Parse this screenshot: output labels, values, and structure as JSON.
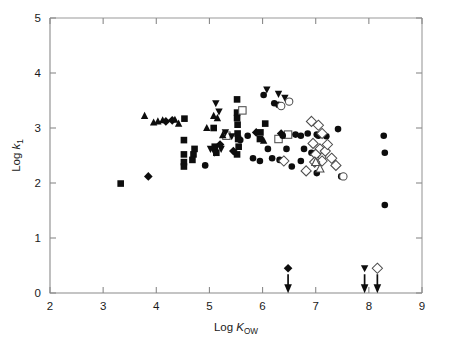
{
  "chart_data": {
    "type": "scatter",
    "title": "",
    "xlabel": "Log K_OW",
    "ylabel": "Log k_1",
    "xlabel_parts": {
      "prefix": "Log ",
      "symbol": "K",
      "subscript": "OW"
    },
    "ylabel_parts": {
      "prefix": "Log ",
      "symbol": "k",
      "subscript": "1"
    },
    "xlim": [
      2,
      9
    ],
    "ylim": [
      0,
      5
    ],
    "xticks": [
      2,
      3,
      4,
      5,
      6,
      7,
      8,
      9
    ],
    "yticks": [
      0,
      1,
      2,
      3,
      4,
      5
    ],
    "xticklabels": [
      "2",
      "3",
      "4",
      "5",
      "6",
      "7",
      "8",
      "9"
    ],
    "yticklabels": [
      "0",
      "1",
      "2",
      "3",
      "4",
      "5"
    ],
    "grid": false,
    "legend": "none",
    "marker_styles": {
      "filled-circle": {
        "shape": "circle",
        "fill": "#0d0d0d",
        "size": 6.6
      },
      "open-circle": {
        "shape": "circle",
        "fill": "#ffffff",
        "size": 7.4
      },
      "filled-square": {
        "shape": "square",
        "fill": "#0d0d0d",
        "size": 6.6
      },
      "open-square": {
        "shape": "square",
        "fill": "#ffffff",
        "size": 7.4
      },
      "filled-triangle-up": {
        "shape": "triangle-up",
        "fill": "#0d0d0d",
        "size": 7.4
      },
      "open-triangle-up": {
        "shape": "triangle-up",
        "fill": "#ffffff",
        "size": 8.0
      },
      "filled-triangle-down": {
        "shape": "triangle-down",
        "fill": "#0d0d0d",
        "size": 7.4
      },
      "filled-diamond": {
        "shape": "diamond",
        "fill": "#0d0d0d",
        "size": 7.0
      },
      "open-diamond": {
        "shape": "diamond",
        "fill": "#ffffff",
        "size": 8.2
      }
    },
    "series": [
      {
        "name": "filled-square",
        "marker": "filled-square",
        "points": [
          [
            3.33,
            1.99
          ],
          [
            4.52,
            2.78
          ],
          [
            4.52,
            2.52
          ],
          [
            4.52,
            2.38
          ],
          [
            4.52,
            2.3
          ],
          [
            4.53,
            3.17
          ],
          [
            5.08,
            3.0
          ],
          [
            5.1,
            2.66
          ],
          [
            5.13,
            2.55
          ],
          [
            5.52,
            3.52
          ],
          [
            5.52,
            3.28
          ],
          [
            5.52,
            3.18
          ],
          [
            5.53,
            3.06
          ],
          [
            5.53,
            2.9
          ],
          [
            5.54,
            2.8
          ],
          [
            5.55,
            2.66
          ],
          [
            5.52,
            2.52
          ],
          [
            4.72,
            2.62
          ],
          [
            4.7,
            2.52
          ],
          [
            4.68,
            2.42
          ],
          [
            5.96,
            2.92
          ],
          [
            5.95,
            2.8
          ],
          [
            6.05,
            3.08
          ]
        ]
      },
      {
        "name": "open-square",
        "marker": "open-square",
        "points": [
          [
            5.62,
            3.32
          ],
          [
            5.32,
            2.86
          ],
          [
            6.3,
            2.8
          ],
          [
            6.48,
            2.88
          ]
        ]
      },
      {
        "name": "filled-triangle-up",
        "marker": "filled-triangle-up",
        "points": [
          [
            3.78,
            3.22
          ],
          [
            3.95,
            3.1
          ],
          [
            4.03,
            3.12
          ],
          [
            4.12,
            3.14
          ],
          [
            4.35,
            3.15
          ],
          [
            4.42,
            3.08
          ],
          [
            4.95,
            3.0
          ],
          [
            5.08,
            3.22
          ],
          [
            5.15,
            3.18
          ],
          [
            5.25,
            2.87
          ],
          [
            6.02,
            2.77
          ]
        ]
      },
      {
        "name": "filled-triangle-down",
        "marker": "filled-triangle-down",
        "points": [
          [
            5.12,
            3.45
          ],
          [
            5.18,
            3.3
          ],
          [
            5.02,
            2.62
          ],
          [
            5.1,
            2.55
          ],
          [
            5.22,
            2.62
          ],
          [
            5.3,
            2.92
          ],
          [
            5.42,
            2.85
          ],
          [
            6.08,
            3.7
          ],
          [
            6.3,
            3.62
          ],
          [
            6.42,
            3.55
          ]
        ]
      },
      {
        "name": "filled-diamond",
        "marker": "filled-diamond",
        "points": [
          [
            3.85,
            2.12
          ],
          [
            4.18,
            3.12
          ],
          [
            4.3,
            3.14
          ],
          [
            5.2,
            2.7
          ],
          [
            5.45,
            2.58
          ],
          [
            5.88,
            2.92
          ],
          [
            6.35,
            2.9
          ]
        ]
      },
      {
        "name": "filled-circle",
        "marker": "filled-circle",
        "points": [
          [
            4.92,
            2.32
          ],
          [
            5.72,
            2.86
          ],
          [
            5.58,
            2.78
          ],
          [
            6.02,
            3.6
          ],
          [
            6.22,
            3.45
          ],
          [
            6.3,
            3.42
          ],
          [
            6.38,
            2.86
          ],
          [
            6.45,
            2.62
          ],
          [
            6.1,
            2.62
          ],
          [
            6.18,
            2.45
          ],
          [
            6.32,
            2.42
          ],
          [
            5.95,
            2.4
          ],
          [
            6.62,
            2.88
          ],
          [
            6.72,
            2.86
          ],
          [
            6.85,
            2.9
          ],
          [
            6.78,
            2.62
          ],
          [
            6.92,
            2.55
          ],
          [
            6.72,
            2.4
          ],
          [
            7.02,
            2.88
          ],
          [
            7.05,
            2.86
          ],
          [
            7.12,
            2.88
          ],
          [
            7.42,
            2.98
          ],
          [
            7.02,
            2.18
          ],
          [
            7.48,
            2.12
          ],
          [
            8.28,
            2.86
          ],
          [
            8.3,
            2.55
          ],
          [
            8.3,
            1.6
          ],
          [
            5.82,
            2.45
          ],
          [
            6.55,
            2.3
          ],
          [
            7.2,
            2.85
          ]
        ]
      },
      {
        "name": "open-circle",
        "marker": "open-circle",
        "points": [
          [
            6.5,
            3.48
          ],
          [
            6.35,
            3.4
          ],
          [
            7.12,
            2.48
          ],
          [
            7.52,
            2.12
          ]
        ]
      },
      {
        "name": "open-diamond",
        "marker": "open-diamond",
        "points": [
          [
            6.92,
            3.12
          ],
          [
            7.05,
            3.05
          ],
          [
            7.12,
            2.9
          ],
          [
            6.95,
            2.72
          ],
          [
            7.08,
            2.62
          ],
          [
            7.0,
            2.52
          ],
          [
            7.18,
            2.58
          ],
          [
            7.22,
            2.7
          ],
          [
            7.3,
            2.45
          ],
          [
            7.12,
            2.4
          ],
          [
            6.98,
            2.38
          ],
          [
            7.38,
            2.32
          ],
          [
            6.4,
            2.4
          ],
          [
            6.82,
            2.22
          ]
        ]
      },
      {
        "name": "open-triangle-up",
        "marker": "open-triangle-up",
        "points": [
          [
            7.0,
            2.38
          ],
          [
            7.08,
            2.26
          ]
        ]
      }
    ],
    "censored_points": [
      {
        "x": 6.48,
        "y": 0.45,
        "marker": "filled-diamond",
        "arrow": "down"
      },
      {
        "x": 7.92,
        "y": 0.45,
        "marker": "filled-triangle-down",
        "arrow": "down"
      },
      {
        "x": 8.16,
        "y": 0.45,
        "marker": "open-diamond",
        "arrow": "down"
      }
    ]
  }
}
